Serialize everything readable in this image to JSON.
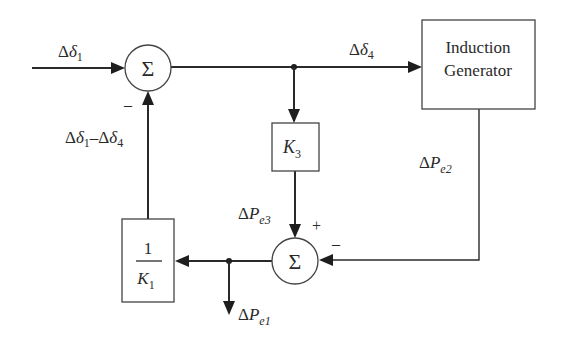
{
  "diagram": {
    "type": "block-diagram",
    "background": "#ffffff",
    "line_color": "#2a2a2a",
    "summing_junctions": [
      {
        "id": "sum_top",
        "symbol": "Σ",
        "signs": {
          "left": "+",
          "bottom": "–"
        }
      },
      {
        "id": "sum_bottom",
        "symbol": "Σ",
        "signs": {
          "top": "+",
          "right": "–"
        }
      }
    ],
    "blocks": [
      {
        "id": "induction_generator",
        "line1": "Induction",
        "line2": "Generator"
      },
      {
        "id": "k3",
        "base": "K",
        "sub": "3"
      },
      {
        "id": "inv_k1",
        "numerator": "1",
        "den_base": "K",
        "den_sub": "1"
      }
    ],
    "signals": {
      "input": {
        "delta": "Δ",
        "sym": "δ",
        "sub": "1"
      },
      "output_top": {
        "delta": "Δ",
        "sym": "δ",
        "sub": "4"
      },
      "feedback": {
        "d1": "Δ",
        "s1": "δ",
        "sub1": "1",
        "minus": "–",
        "d2": "Δ",
        "s2": "δ",
        "sub2": "4"
      },
      "pe2": {
        "delta": "Δ",
        "sym": "P",
        "sub": "e2"
      },
      "pe3": {
        "delta": "Δ",
        "sym": "P",
        "sub": "e3"
      },
      "pe1": {
        "delta": "Δ",
        "sym": "P",
        "sub": "e1"
      }
    },
    "sign_labels": {
      "top_minus": "–",
      "bottom_plus": "+",
      "bottom_minus": "–"
    }
  }
}
